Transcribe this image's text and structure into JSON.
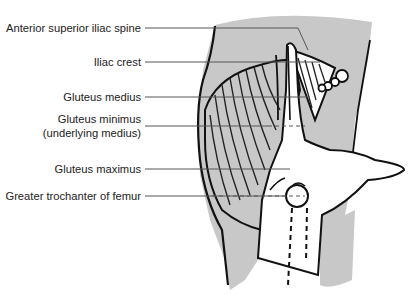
{
  "figure": {
    "labels": [
      {
        "id": "asis",
        "text": "Anterior superior iliac spine",
        "y": 28
      },
      {
        "id": "iliac-crest",
        "text": "Iliac crest",
        "y": 62
      },
      {
        "id": "gluteus-medius",
        "text": "Gluteus medius",
        "y": 97
      },
      {
        "id": "gluteus-minimus",
        "text": "Gluteus minimus",
        "text2": "(underlying medius)",
        "y": 126
      },
      {
        "id": "gluteus-maximus",
        "text": "Gluteus maximus",
        "y": 169
      },
      {
        "id": "greater-trochanter",
        "text": "Greater trochanter of femur",
        "y": 196
      }
    ],
    "colors": {
      "skin_shade": "#c8c8c8",
      "outline": "#111111",
      "leader_line": "#555555",
      "text": "#222222"
    }
  }
}
